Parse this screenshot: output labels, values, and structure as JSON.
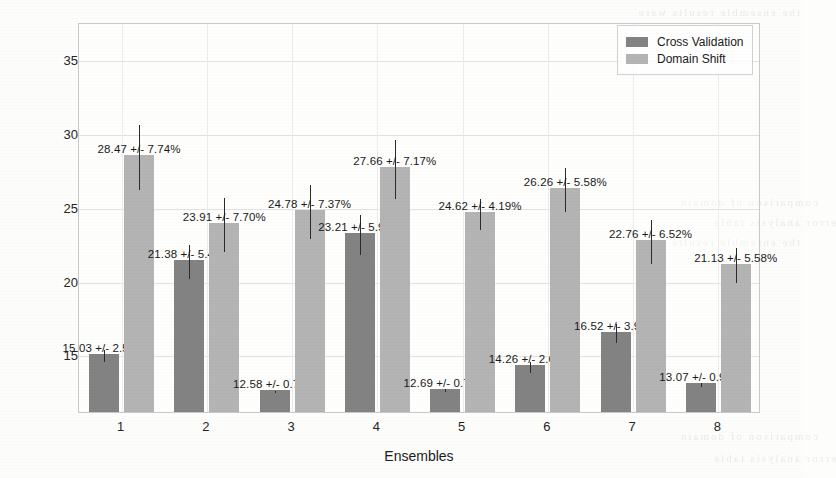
{
  "chart_data": {
    "type": "bar",
    "title": "",
    "xlabel": "Ensembles",
    "ylabel": "Mean Absolute Error (MAE)",
    "categories": [
      "1",
      "2",
      "3",
      "4",
      "5",
      "6",
      "7",
      "8"
    ],
    "ylim": [
      11.1,
      37.5
    ],
    "yticks": [
      15,
      20,
      25,
      30,
      35
    ],
    "ytick_labels": [
      "15",
      "20",
      "25",
      "30",
      "35"
    ],
    "grid": true,
    "legend_position": "upper right",
    "series": [
      {
        "name": "Cross Validation",
        "color": "#838383",
        "values": [
          15.03,
          21.38,
          12.58,
          23.21,
          12.69,
          14.26,
          16.52,
          13.07
        ],
        "error_pct": [
          2.59,
          5.46,
          0.72,
          5.95,
          0.72,
          2.69,
          3.92,
          0.92
        ],
        "labels": [
          "15.03 +/- 2.59%",
          "21.38 +/- 5.46%",
          "12.58 +/- 0.72%",
          "23.21 +/- 5.95%",
          "12.69 +/- 0.72%",
          "14.26 +/- 2.69%",
          "16.52 +/- 3.92%",
          "13.07 +/- 0.92%"
        ]
      },
      {
        "name": "Domain Shift",
        "color": "#b4b4b4",
        "values": [
          28.47,
          23.91,
          24.78,
          27.66,
          24.62,
          26.26,
          22.76,
          21.13
        ],
        "error_pct": [
          7.74,
          7.7,
          7.37,
          7.17,
          4.19,
          5.58,
          6.52,
          5.58
        ],
        "labels": [
          "28.47 +/- 7.74%",
          "23.91 +/- 7.70%",
          "24.78 +/- 7.37%",
          "27.66 +/- 7.17%",
          "24.62 +/- 4.19%",
          "26.26 +/- 5.58%",
          "22.76 +/- 6.52%",
          "21.13 +/- 5.58%"
        ]
      }
    ]
  },
  "legend": {
    "entries": [
      {
        "label": "Cross Validation",
        "color": "#838383"
      },
      {
        "label": "Domain Shift",
        "color": "#b4b4b4"
      }
    ]
  },
  "bleed_through": [
    "the ensemble results were",
    "comparison of domain",
    "error analysis table"
  ]
}
